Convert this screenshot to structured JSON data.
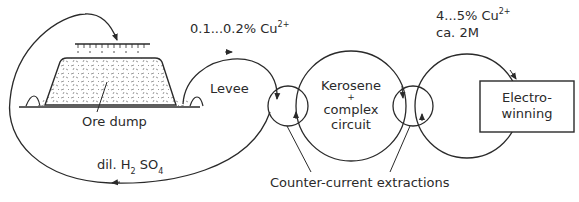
{
  "diagram": {
    "type": "process-flow",
    "colors": {
      "line": "#2a2a2a",
      "background": "#ffffff"
    },
    "nodes": {
      "ore_dump": {
        "label": "Ore dump"
      },
      "levee": {
        "label": "Levee"
      },
      "kerosene_circuit": {
        "line1": "Kerosene",
        "line2": "+",
        "line3": "complex",
        "line4": "circuit"
      },
      "electrowinning": {
        "line1": "Electro-",
        "line2": "winning"
      }
    },
    "flows": {
      "pregnant_solution": {
        "prefix": "0.1...0.2% Cu",
        "sup": "2+"
      },
      "electrolyte": {
        "line1_prefix": "4...5% Cu",
        "line1_sup": "2+",
        "line2": "ca. 2M"
      },
      "raffinate": {
        "prefix": "dil. H",
        "sub1": "2",
        "mid": " SO",
        "sub2": "4"
      }
    },
    "annotations": {
      "extractions": "Counter-current extractions"
    }
  }
}
